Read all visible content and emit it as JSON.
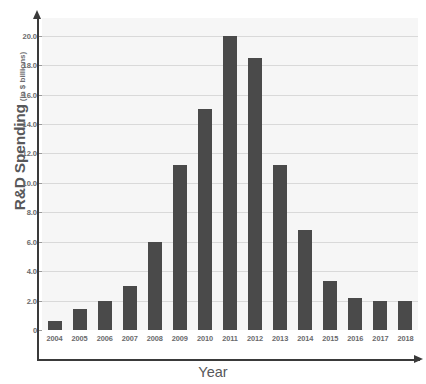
{
  "chart_data": {
    "type": "bar",
    "title": "",
    "xlabel": "Year",
    "ylabel": "R&D Spending",
    "ylabel_unit": "(in $ billions)",
    "categories": [
      "2004",
      "2005",
      "2006",
      "2007",
      "2008",
      "2009",
      "2010",
      "2011",
      "2012",
      "2013",
      "2014",
      "2015",
      "2016",
      "2017",
      "2018"
    ],
    "values": [
      0.6,
      1.4,
      2.0,
      3.0,
      6.0,
      11.2,
      15.0,
      20.0,
      18.5,
      11.2,
      6.8,
      3.3,
      2.2,
      2.0,
      2.0
    ],
    "ylim": [
      0,
      21.2
    ],
    "ytick_values": [
      0,
      2.0,
      4.0,
      6.0,
      8.0,
      10.0,
      12.0,
      14.0,
      16.0,
      18.0,
      20.0
    ],
    "ytick_labels": [
      "0",
      "2.0",
      "4.0",
      "6.0",
      "8.0",
      "10.0",
      "12.0",
      "14.0",
      "16.0",
      "18.0",
      "20.0"
    ],
    "grid": true,
    "legend": false,
    "bar_color": "#4a4a4a",
    "plot_background": "#f6f6f6",
    "gridline_color": "#d9d9d9",
    "axis_color": "#3a3a3a",
    "text_color": "#58585a"
  }
}
